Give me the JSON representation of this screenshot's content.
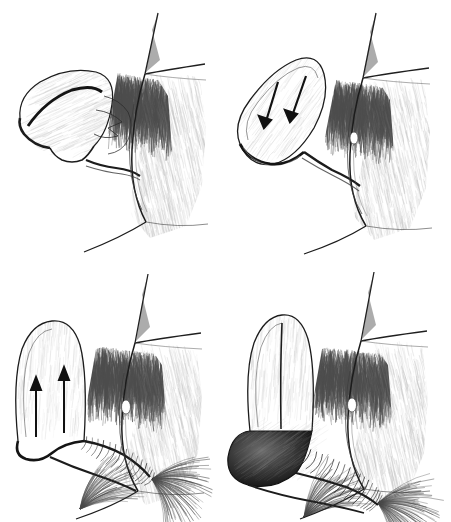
{
  "figure": {
    "medium": "pen-and-ink anatomical line drawing",
    "view": "sagittal cross-section",
    "width": 451,
    "height": 522,
    "background_color": "#ffffff",
    "ink_color": "#1a1a1a",
    "mid_tone_color": "#6e6e6e",
    "light_tone_color": "#b8b8b8",
    "label_color": "#3b3b3b",
    "grid": {
      "rows": 2,
      "columns": 2
    }
  },
  "panels": [
    {
      "id": "nonstimulated",
      "label": "Nonstimulated state",
      "order": 1,
      "arrows": 0,
      "arrow_direction": "none",
      "organ_state": "flaccid, folded downward",
      "position": {
        "left": 0,
        "top": 0
      }
    },
    {
      "id": "excitement",
      "label": "Excitement phase",
      "order": 2,
      "arrows": 2,
      "arrow_direction": "down",
      "organ_state": "partially tumescent, angled upward",
      "position": {
        "left": 226,
        "top": 0
      }
    },
    {
      "id": "plateau",
      "label": "Plateau phase",
      "order": 3,
      "arrows": 2,
      "arrow_direction": "up",
      "organ_state": "erect, vertical with ridged shaft",
      "position": {
        "left": 0,
        "top": 261
      }
    },
    {
      "id": "orgasmic",
      "label": "Orgasmic phase",
      "order": 4,
      "arrows": 0,
      "arrow_direction": "none",
      "organ_state": "fully erect, engorged distal end",
      "position": {
        "left": 226,
        "top": 261
      }
    }
  ]
}
